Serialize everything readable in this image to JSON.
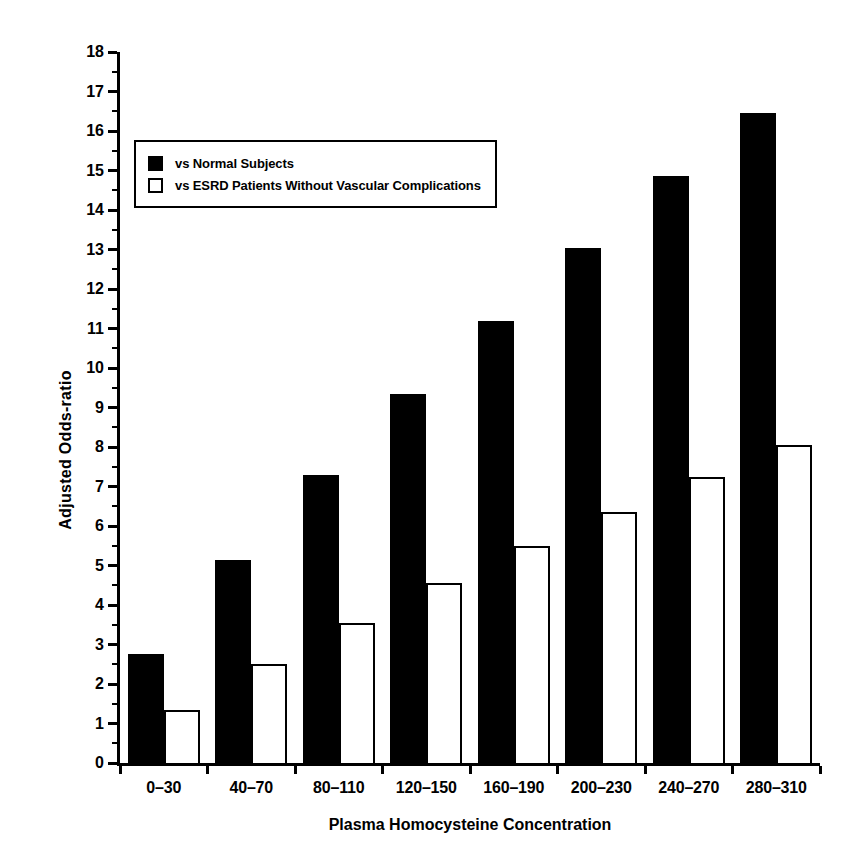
{
  "chart_data": {
    "type": "bar",
    "title": "",
    "xlabel": "Plasma Homocysteine Concentration",
    "ylabel": "Adjusted Odds-ratio",
    "categories": [
      "0–30",
      "40–70",
      "80–110",
      "120–150",
      "160–190",
      "200–230",
      "240–270",
      "280–310"
    ],
    "series": [
      {
        "name": "vs Normal Subjects",
        "style": "filled",
        "color": "#000000",
        "values": [
          2.75,
          5.15,
          7.3,
          9.35,
          11.2,
          13.05,
          14.85,
          16.45
        ]
      },
      {
        "name": "vs ESRD Patients Without Vascular Complications",
        "style": "open",
        "color": "#ffffff",
        "values": [
          1.35,
          2.5,
          3.55,
          4.55,
          5.5,
          6.35,
          7.25,
          8.05
        ]
      }
    ],
    "ylim": [
      0,
      18
    ],
    "ytick_step": 1,
    "yminor_step": 0.5,
    "ytick_labels": [
      "0",
      "1",
      "2",
      "3",
      "4",
      "5",
      "6",
      "7",
      "8",
      "9",
      "10",
      "11",
      "12",
      "13",
      "14",
      "15",
      "16",
      "17",
      "18"
    ],
    "grid": false,
    "legend_position": "upper-left-inside"
  },
  "legend": {
    "entries": [
      {
        "label": "vs Normal Subjects",
        "swatch": "filled-square-icon"
      },
      {
        "label": "vs ESRD Patients Without Vascular Complications",
        "swatch": "open-square-icon"
      }
    ]
  }
}
